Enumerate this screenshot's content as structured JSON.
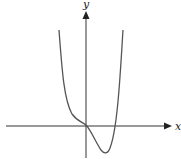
{
  "diagram": {
    "type": "function-graph",
    "axes": {
      "x_label": "x",
      "y_label": "y"
    },
    "colors": {
      "axis": "#333333",
      "curve": "#555555",
      "background": "#ffffff"
    },
    "curve_description": "Quartic-like curve: decreasing steeply from upper left, inflection near origin, passes through origin, local minimum below x-axis in fourth quadrant, crosses positive x-axis, rises steeply"
  }
}
